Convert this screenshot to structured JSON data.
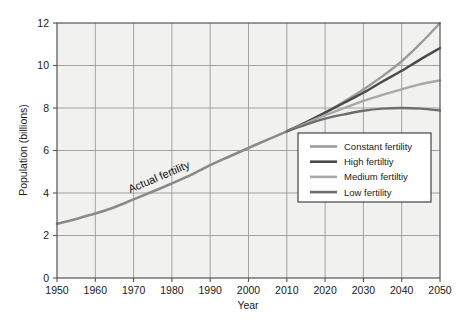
{
  "chart_data": {
    "type": "line",
    "title": "",
    "xlabel": "Year",
    "ylabel": "Population (billions)",
    "xlim": [
      1950,
      2050
    ],
    "ylim": [
      0,
      12
    ],
    "grid": true,
    "legend_position": "inside-lower-right",
    "x_ticks": [
      "1950",
      "1960",
      "1970",
      "1980",
      "1990",
      "2000",
      "2010",
      "2020",
      "2030",
      "2040",
      "2050"
    ],
    "y_ticks": [
      "0",
      "2",
      "4",
      "6",
      "8",
      "10",
      "12"
    ],
    "annotations": [
      {
        "text": "Actual fertility",
        "x": 1977,
        "y": 4.6,
        "rotation": -23
      }
    ],
    "series": [
      {
        "name": "Actual fertility",
        "color": "#8a8a8a",
        "width": 2.6,
        "x": [
          1950,
          1955,
          1960,
          1965,
          1970,
          1975,
          1980,
          1985,
          1990,
          1995,
          2000,
          2005,
          2010
        ],
        "values": [
          2.55,
          2.78,
          3.03,
          3.33,
          3.7,
          4.07,
          4.45,
          4.85,
          5.31,
          5.72,
          6.12,
          6.51,
          6.9
        ]
      },
      {
        "name": "Constant fertility",
        "color": "#9b9b9b",
        "width": 2.4,
        "x": [
          2010,
          2015,
          2020,
          2025,
          2030,
          2035,
          2040,
          2045,
          2050
        ],
        "values": [
          6.9,
          7.32,
          7.78,
          8.3,
          8.87,
          9.5,
          10.2,
          11.05,
          12.0
        ]
      },
      {
        "name": "High fertiltiy",
        "color": "#4a4a4a",
        "width": 2.4,
        "x": [
          2010,
          2015,
          2020,
          2025,
          2030,
          2035,
          2040,
          2045,
          2050
        ],
        "values": [
          6.9,
          7.33,
          7.78,
          8.25,
          8.72,
          9.25,
          9.75,
          10.3,
          10.82
        ]
      },
      {
        "name": "Medium fertiltiy",
        "color": "#a8a8a8",
        "width": 2.4,
        "x": [
          2010,
          2015,
          2020,
          2025,
          2030,
          2035,
          2040,
          2045,
          2050
        ],
        "values": [
          6.9,
          7.28,
          7.66,
          8.0,
          8.33,
          8.62,
          8.88,
          9.12,
          9.3
        ]
      },
      {
        "name": "Low fertility",
        "color": "#6e6e6e",
        "width": 2.4,
        "x": [
          2010,
          2015,
          2020,
          2025,
          2030,
          2035,
          2040,
          2045,
          2050
        ],
        "values": [
          6.9,
          7.22,
          7.5,
          7.7,
          7.87,
          7.97,
          8.0,
          7.97,
          7.88
        ]
      }
    ]
  },
  "legend": {
    "items": [
      {
        "label": "Constant fertility",
        "color": "#9b9b9b"
      },
      {
        "label": "High fertiltiy",
        "color": "#4a4a4a"
      },
      {
        "label": "Medium fertiltiy",
        "color": "#a8a8a8"
      },
      {
        "label": "Low fertility",
        "color": "#6e6e6e"
      }
    ]
  },
  "style": {
    "plot_background": "#f1f1ef",
    "grid_color": "#9a9a9a",
    "axis_color": "#555555",
    "page_background": "#ffffff"
  }
}
